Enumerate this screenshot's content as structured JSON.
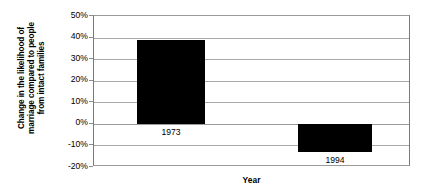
{
  "chart_data": {
    "type": "bar",
    "title": "",
    "categories": [
      "1973",
      "1994"
    ],
    "values": [
      39,
      -13
    ],
    "series": [
      {
        "name": "Change in likelihood of marriage",
        "values": [
          39,
          -13
        ],
        "color": "#000000"
      }
    ],
    "xlabel": "Year",
    "ylabel": "Change in the likelihood of marriage compared to people from intact families",
    "ylabel_lines": [
      "Change in the likelihood of",
      "marriage compared to people",
      "from intact families"
    ],
    "ylim": [
      -20,
      50
    ],
    "ytick_values": [
      50,
      40,
      30,
      20,
      10,
      0,
      -10,
      -20
    ],
    "ytick_labels": [
      "50%",
      "40%",
      "30%",
      "20%",
      "10%",
      "0%",
      "-10%",
      "-20%"
    ],
    "grid": true,
    "legend": "none",
    "data_labels": [
      "1973",
      "1994"
    ],
    "colors": {
      "bar": "#000000",
      "gridline": "#a8a8a8",
      "axis": "#7a7a7a",
      "background": "#ffffff",
      "text": "#000000"
    }
  }
}
